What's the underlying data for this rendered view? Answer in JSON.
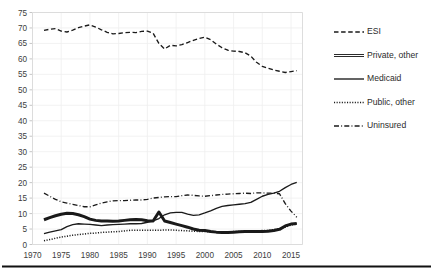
{
  "chart_data": {
    "type": "line",
    "title": "",
    "subtitle": "",
    "xlabel": "",
    "ylabel": "",
    "xlim": [
      1970,
      2017
    ],
    "ylim": [
      0,
      75
    ],
    "ytick_step": 5,
    "xtick_step": 5,
    "grid": true,
    "legend_position": "right",
    "yticks": [
      "0",
      "5",
      "10",
      "15",
      "20",
      "25",
      "30",
      "35",
      "40",
      "45",
      "50",
      "55",
      "60",
      "65",
      "70",
      "75"
    ],
    "xticks": [
      "1970",
      "1975",
      "1980",
      "1985",
      "1990",
      "1995",
      "2000",
      "2005",
      "2010",
      "2015"
    ],
    "x": [
      1972,
      1973,
      1974,
      1975,
      1976,
      1977,
      1978,
      1979,
      1980,
      1981,
      1982,
      1983,
      1984,
      1985,
      1986,
      1987,
      1988,
      1989,
      1990,
      1991,
      1992,
      1993,
      1994,
      1995,
      1996,
      1997,
      1998,
      1999,
      2000,
      2001,
      2002,
      2003,
      2004,
      2005,
      2006,
      2007,
      2008,
      2009,
      2010,
      2011,
      2012,
      2013,
      2014,
      2015,
      2016
    ],
    "series": [
      {
        "name": "ESI",
        "style": "dashed",
        "color": "#1a1a1a",
        "values": [
          69.2,
          69.6,
          69.8,
          69.0,
          68.7,
          69.3,
          70.1,
          70.6,
          71.0,
          70.3,
          69.4,
          68.6,
          68.1,
          68.2,
          68.5,
          68.6,
          68.5,
          68.9,
          69.0,
          68.3,
          65.0,
          63.2,
          64.4,
          64.2,
          64.6,
          65.3,
          66.0,
          66.6,
          67.0,
          66.2,
          64.8,
          63.6,
          62.8,
          62.5,
          62.4,
          62.0,
          60.9,
          58.9,
          57.6,
          57.0,
          56.4,
          56.0,
          55.6,
          55.9,
          56.2
        ]
      },
      {
        "name": "Private, other",
        "style": "double",
        "color": "#1a1a1a",
        "values": [
          8.0,
          8.7,
          9.3,
          9.8,
          10.1,
          10.0,
          9.6,
          9.0,
          8.2,
          7.8,
          7.6,
          7.6,
          7.5,
          7.6,
          7.8,
          8.0,
          8.1,
          8.0,
          7.7,
          7.6,
          10.5,
          7.6,
          7.1,
          6.6,
          6.1,
          5.6,
          5.0,
          4.6,
          4.5,
          4.2,
          4.0,
          3.9,
          3.9,
          4.0,
          4.1,
          4.2,
          4.2,
          4.2,
          4.2,
          4.3,
          4.5,
          4.9,
          6.0,
          6.6,
          6.8
        ]
      },
      {
        "name": "Medicaid",
        "style": "solid",
        "color": "#1a1a1a",
        "values": [
          3.5,
          4.0,
          4.4,
          4.8,
          5.8,
          6.4,
          6.7,
          6.6,
          6.5,
          6.3,
          6.1,
          6.3,
          6.4,
          6.5,
          6.6,
          6.7,
          6.7,
          6.8,
          7.2,
          7.6,
          8.4,
          9.6,
          10.2,
          10.4,
          10.4,
          9.8,
          9.4,
          9.6,
          10.2,
          10.9,
          11.7,
          12.3,
          12.6,
          12.8,
          13.0,
          13.2,
          13.6,
          14.6,
          15.6,
          16.2,
          16.6,
          17.2,
          18.4,
          19.4,
          20.1
        ]
      },
      {
        "name": "Public, other",
        "style": "dotted",
        "color": "#1a1a1a",
        "values": [
          1.2,
          1.6,
          2.0,
          2.4,
          2.7,
          3.0,
          3.2,
          3.4,
          3.6,
          3.7,
          3.9,
          4.0,
          4.1,
          4.2,
          4.4,
          4.6,
          4.6,
          4.6,
          4.6,
          4.6,
          4.6,
          4.7,
          4.7,
          4.6,
          4.5,
          4.4,
          4.3,
          4.2,
          4.2,
          4.1,
          4.1,
          4.1,
          4.1,
          4.2,
          4.2,
          4.2,
          4.3,
          4.4,
          4.5,
          4.6,
          4.8,
          5.0,
          5.6,
          6.3,
          6.6
        ]
      },
      {
        "name": "Uninsured",
        "style": "dashdot",
        "color": "#1a1a1a",
        "values": [
          16.6,
          15.6,
          14.6,
          13.8,
          13.4,
          13.0,
          12.6,
          12.2,
          12.2,
          12.8,
          13.4,
          13.8,
          14.1,
          14.2,
          14.2,
          14.3,
          14.4,
          14.4,
          14.6,
          15.0,
          15.2,
          15.4,
          15.5,
          15.5,
          15.8,
          16.0,
          15.9,
          15.7,
          15.6,
          15.8,
          16.0,
          16.2,
          16.3,
          16.4,
          16.5,
          16.6,
          16.5,
          16.7,
          16.7,
          16.6,
          16.6,
          16.4,
          13.2,
          10.8,
          8.8
        ]
      }
    ]
  },
  "legend": {
    "items": [
      {
        "label": "ESI",
        "style": "dashed"
      },
      {
        "label": "Private, other",
        "style": "double"
      },
      {
        "label": "Medicaid",
        "style": "solid"
      },
      {
        "label": "Public, other",
        "style": "dotted"
      },
      {
        "label": "Uninsured",
        "style": "dashdot"
      }
    ]
  }
}
